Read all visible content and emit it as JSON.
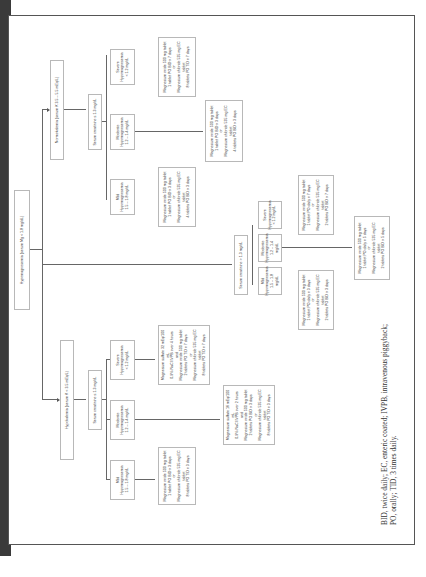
{
  "root": "Hypomagnesemia (serum Mg < 1.8 mg/dL)",
  "branches": {
    "hypokalemia": {
      "label": "Hypokalemia (serum K < 3.5 mEq/L)",
      "creatinine": "Serum creatinine ≤ 1.3 mg/dL",
      "severity": [
        {
          "name": "Mild",
          "sub": "Hypomagnesemia",
          "range": "1.5 – 1.8 mg/dL"
        },
        {
          "name": "Moderate",
          "sub": "Hypomagnesemia",
          "range": "1.2 – 1.4 mg/dL"
        },
        {
          "name": "Severe",
          "sub": "Hypomagnesemia",
          "range": "< 1.2 mg/dL"
        }
      ],
      "treatments": [
        [
          "Magnesium oxide 500 mg tablet",
          "1 tablet PO BID x 3 days",
          "or",
          "Magnesium chloride 535 mg EC tablet",
          "8 tablets PO TID x 3 days"
        ],
        [
          "Magnesium sulfate 16 mEq/100 mL",
          "0.9% NaCl IVPB over 2 hours",
          "and",
          "Magnesium oxide 500 mg tablet",
          "2 tablets PO BID x 3 days",
          "or",
          "Magnesium chloride 535 mg EC tablet",
          "8 tablets PO TID x 3 days"
        ],
        [
          "Magnesium sulfate 32 mEq/100 mL",
          "0.9% NaCl IVPB over 4 hours",
          "and",
          "Magnesium oxide 500 mg tablet",
          "2 tablets PO TID x 7 days",
          "or",
          "Magnesium chloride 535 mg EC tablet",
          "8 tablets PO TID x 7 days"
        ]
      ],
      "creatinine_high": "Serum creatinine > 1.3 mg/dL",
      "high_severity": [
        {
          "name": "Mild",
          "sub": "Hypomagnesemia",
          "range": "1.5 – 1.8 mg/dL"
        },
        {
          "name": "Moderate",
          "sub": "Hypomagnesemia",
          "range": "1.2 – 1.4 mg/dL"
        },
        {
          "name": "Severe",
          "sub": "Hypomagnesemia",
          "range": "< 1.2 mg/dL"
        }
      ],
      "high_treatments": [
        [
          "Magnesium oxide 500 mg tablet",
          "1 tablet PO daily x 3 days",
          "or",
          "Magnesium chloride 535 mg EC tablet",
          "2 tablets PO BID x 3 days"
        ],
        [
          "Magnesium oxide 500 mg tablet",
          "1 tablet PO daily x 7 days",
          "or",
          "Magnesium chloride 535 mg EC tablet",
          "2 tablets PO BID x 7 days"
        ]
      ],
      "high_bottom": [
        "Magnesium oxide 500 mg tablet",
        "1 tablet PO daily x 5 days",
        "or",
        "Magnesium chloride 535 mg EC tablet",
        "2 tablets PO BID x 5 days"
      ]
    },
    "normokalemia": {
      "label": "Normokalemia (serum K 3.5 – 5.5 mEq/L)",
      "creatinine": "Serum creatinine ≤ 1.3 mg/dL",
      "severity": [
        {
          "name": "Mild",
          "sub": "Hypomagnesemia",
          "range": "1.5 – 1.8 mg/dL"
        },
        {
          "name": "Moderate",
          "sub": "Hypomagnesemia",
          "range": "1.2 – 1.4 mg/dL"
        },
        {
          "name": "Severe",
          "sub": "Hypomagnesemia",
          "range": "< 1.2 mg/dL"
        }
      ],
      "treatments": [
        [
          "Magnesium oxide 500 mg tablet",
          "1 tablet PO BID x 3 days",
          "or",
          "Magnesium chloride 535 mg EC tablet",
          "4 tablets PO BID x 3 days"
        ],
        [
          "Magnesium oxide 500 mg tablet",
          "1 tablet PO BID x 7 days",
          "or",
          "Magnesium chloride 535 mg EC tablet",
          "8 tablets PO TID x 7 days"
        ]
      ],
      "bottom": [
        "Magnesium oxide 500 mg tablet",
        "1 tablet PO BID x 3 days",
        "or",
        "Magnesium chloride 535 mg EC tablet",
        "4 tablets PO BID x 3 days"
      ]
    }
  },
  "footnote": "BID, twice daily; EC, enteric coated; IVPB, intravenous piggyback; PO, orally; TID, 3 times daily."
}
